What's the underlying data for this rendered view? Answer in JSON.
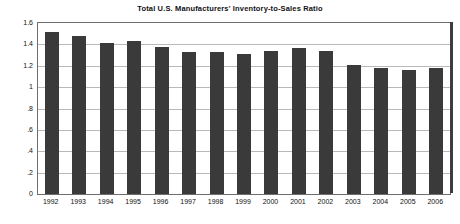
{
  "chart_data": {
    "type": "bar",
    "title": "Total U.S. Manufacturers' Inventory-to-Sales Ratio",
    "xlabel": "",
    "ylabel": "",
    "categories": [
      "1992",
      "1993",
      "1994",
      "1995",
      "1996",
      "1997",
      "1998",
      "1999",
      "2000",
      "2001",
      "2002",
      "2003",
      "2004",
      "2005",
      "2006"
    ],
    "values": [
      1.52,
      1.48,
      1.41,
      1.43,
      1.38,
      1.33,
      1.33,
      1.31,
      1.34,
      1.37,
      1.34,
      1.21,
      1.18,
      1.16,
      1.18
    ],
    "ylim": [
      0,
      1.6
    ],
    "ytick_values": [
      0,
      0.2,
      0.4,
      0.6,
      0.8,
      1,
      1.2,
      1.4,
      1.6
    ],
    "ytick_labels": [
      "0",
      ".2",
      ".4",
      ".6",
      ".8",
      "1",
      "1.2",
      "1.4",
      "1.6"
    ],
    "grid": true,
    "legend": false,
    "legend_position": "none",
    "bar_color": "#3a3a3a",
    "gridline_color": "#b9b9b9",
    "frame_color": "#6e6e6e",
    "background_color": "#ffffff"
  }
}
